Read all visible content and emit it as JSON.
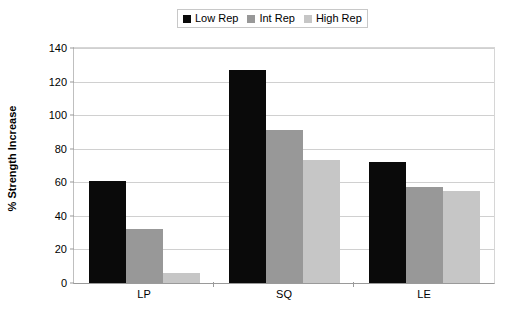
{
  "chart_data": {
    "type": "bar",
    "title": "",
    "xlabel": "",
    "ylabel": "% Strength Increase",
    "categories": [
      "LP",
      "SQ",
      "LE"
    ],
    "series": [
      {
        "name": "Low Rep",
        "color": "#0a0a0a",
        "values": [
          61,
          127,
          72
        ]
      },
      {
        "name": "Int Rep",
        "color": "#989898",
        "values": [
          32,
          91,
          57
        ]
      },
      {
        "name": "High Rep",
        "color": "#c6c6c6",
        "values": [
          6,
          73,
          55
        ]
      }
    ],
    "ylim": [
      0,
      140
    ],
    "ytick_step": 20,
    "yticks": [
      140,
      120,
      100,
      80,
      60,
      40,
      20,
      0
    ],
    "ytick_labels": [
      "140",
      "120",
      "100",
      "80",
      "60",
      "40",
      "20",
      "0"
    ],
    "grid": true,
    "grid_axis": "y",
    "legend_position": "top-center",
    "legend_border": true,
    "plot_background": "#ffffff",
    "gridline_color": "#d0d0d0",
    "axis_color": "#9a9a9a"
  },
  "legend": {
    "items": [
      {
        "label": "Low Rep"
      },
      {
        "label": "Int Rep"
      },
      {
        "label": "High Rep"
      }
    ]
  },
  "axes": {
    "y_title": "% Strength Increase"
  }
}
